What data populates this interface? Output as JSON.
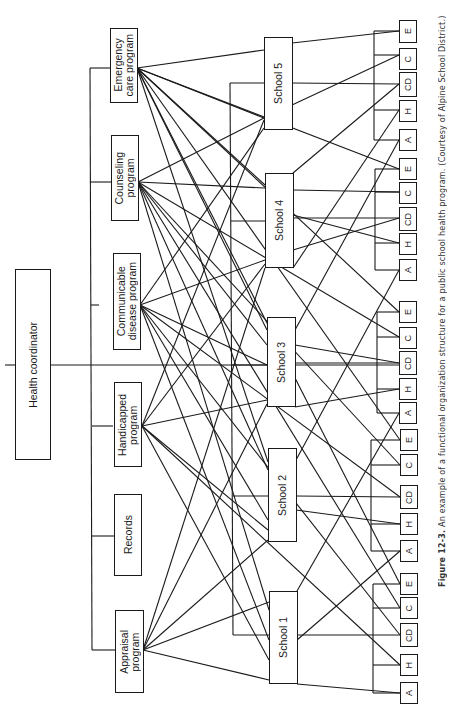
{
  "coordinator": {
    "label": "Health coordinator"
  },
  "programs": [
    {
      "id": "emergency",
      "label": "Emergency\ncare program",
      "code": "E"
    },
    {
      "id": "counseling",
      "label": "Counseling\nprogram",
      "code": "C"
    },
    {
      "id": "communicable",
      "label": "Communicable\ndisease program",
      "code": "CD"
    },
    {
      "id": "handicapped",
      "label": "Handicapped\nprogram",
      "code": "H"
    },
    {
      "id": "records",
      "label": "Records",
      "code": ""
    },
    {
      "id": "appraisal",
      "label": "Appraisal\nprogram",
      "code": "A"
    }
  ],
  "schools": [
    {
      "label": "School 5",
      "units": [
        "E",
        "C",
        "CD",
        "H",
        "A"
      ]
    },
    {
      "label": "School 4",
      "units": [
        "E",
        "C",
        "CD",
        "H",
        "A"
      ]
    },
    {
      "label": "School 3",
      "units": [
        "E",
        "C",
        "CD",
        "H",
        "A"
      ]
    },
    {
      "label": "School 2",
      "units": [
        "E",
        "C",
        "CD",
        "H",
        "A"
      ]
    },
    {
      "label": "School 1",
      "units": [
        "E",
        "C",
        "CD",
        "H",
        "A"
      ]
    }
  ],
  "caption": {
    "figure": "Figure 12-3.",
    "text": "An example of a functional organization structure for a public school health program. (Courtesy of Alpine School District.)"
  }
}
